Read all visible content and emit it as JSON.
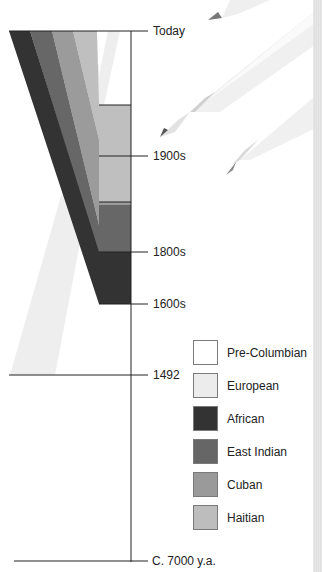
{
  "timeline": {
    "labels": [
      {
        "id": "today",
        "text": "Today",
        "y": 31
      },
      {
        "id": "1900s",
        "text": "1900s",
        "y": 156
      },
      {
        "id": "1800s",
        "text": "1800s",
        "y": 252
      },
      {
        "id": "1600s",
        "text": "1600s",
        "y": 304
      },
      {
        "id": "1492",
        "text": "1492",
        "y": 375
      },
      {
        "id": "7000ya",
        "text": "C. 7000 y.a.",
        "y": 561
      }
    ]
  },
  "legend": {
    "items": [
      {
        "label": "Pre-Columbian",
        "color": "#ffffff"
      },
      {
        "label": "European",
        "color": "#ececec"
      },
      {
        "label": "African",
        "color": "#333333"
      },
      {
        "label": "East Indian",
        "color": "#666666"
      },
      {
        "label": "Cuban",
        "color": "#9a9a9a"
      },
      {
        "label": "Haitian",
        "color": "#bdbdbd"
      }
    ]
  },
  "colors": {
    "axis": "#222222",
    "pencil_body": "#f2f2f2",
    "pencil_shade": "#d6d6d6",
    "pencil_lead": "#555555"
  }
}
